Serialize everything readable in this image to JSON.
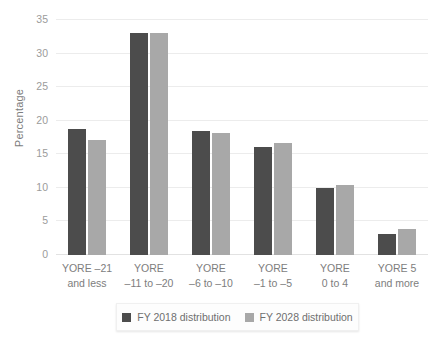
{
  "chart_data": {
    "type": "bar",
    "title": "",
    "xlabel": "",
    "ylabel": "Percentage",
    "ylim": [
      0,
      35
    ],
    "yticks": [
      "0",
      "5",
      "10",
      "15",
      "20",
      "25",
      "30",
      "35"
    ],
    "ytick_values": [
      0,
      5,
      10,
      15,
      20,
      25,
      30,
      35
    ],
    "grid": true,
    "legend_position": "bottom",
    "categories": [
      "YORE –21 and less",
      "YORE –11 to –20",
      "YORE –6 to –10",
      "YORE –1 to –5",
      "YORE 0 to 4",
      "YORE 5 and more"
    ],
    "category_lines": [
      [
        "YORE –21",
        "and less"
      ],
      [
        "YORE",
        "–11 to –20"
      ],
      [
        "YORE",
        "–6 to –10"
      ],
      [
        "YORE",
        "–1 to –5"
      ],
      [
        "YORE",
        "0 to 4"
      ],
      [
        "YORE 5",
        "and more"
      ]
    ],
    "series": [
      {
        "name": "FY 2018 distribution",
        "color": "#4c4c4c",
        "values": [
          18.7,
          33.0,
          18.4,
          16.1,
          10.0,
          3.2
        ]
      },
      {
        "name": "FY 2028 distribution",
        "color": "#a8a8a8",
        "values": [
          17.2,
          33.0,
          18.2,
          16.7,
          10.4,
          3.9
        ]
      }
    ]
  },
  "legend": {
    "items": [
      {
        "label": "FY 2018 distribution",
        "color": "#4c4c4c",
        "swatch_name": "legend-swatch-fy2018"
      },
      {
        "label": "FY 2028 distribution",
        "color": "#a8a8a8",
        "swatch_name": "legend-swatch-fy2028"
      }
    ]
  },
  "colors": {
    "series_dark": "#4c4c4c",
    "series_light": "#a8a8a8",
    "gridline": "#ececec",
    "text": "#7d7d7d"
  }
}
